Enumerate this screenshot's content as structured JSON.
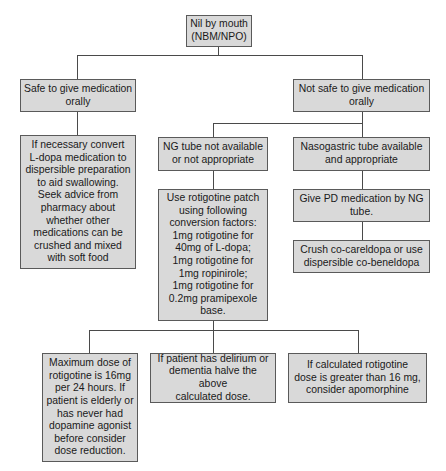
{
  "diagram": {
    "type": "flowchart",
    "root": {
      "label": "Nil by mouth\n(NBM/NPO)"
    },
    "branches": {
      "safe": {
        "label": "Safe to give medication\norally",
        "advice": "If necessary convert\nL-dopa medication to\ndispersible preparation\nto aid swallowing.\nSeek advice from\npharmacy about\nwhether other\nmedications can be\ncrushed and mixed\nwith soft food"
      },
      "not_safe": {
        "label": "Not safe to give medication\norally",
        "ng_not_available": {
          "label": "NG tube not available\nor not appropriate",
          "rotigotine": "Use rotigotine patch\nusing following\nconversion factors:\n1mg rotigotine for\n40mg of L-dopa;\n1mg rotigotine for\n1mg ropinirole;\n1mg rotigotine for\n0.2mg pramipexole\nbase.",
          "notes": [
            "Maximum dose of\nrotigotine is 16mg\nper 24 hours. If\npatient is elderly or\nhas never had\ndopamine agonist\nbefore consider\ndose reduction.",
            "If patient has delirium or\ndementia halve the above\ncalculated dose.",
            "If calculated rotigotine\ndose is greater than 16 mg,\nconsider apomorphine"
          ]
        },
        "ng_available": {
          "label": "Nasogastric tube available\nand appropriate",
          "give": "Give PD medication by NG\ntube.",
          "crush": "Crush co-careldopa or use\ndispersible co-beneldopa"
        }
      }
    },
    "colors": {
      "box_fill": "#d9d9d9",
      "box_border": "#5a5a5a",
      "connector": "#4a4a4a",
      "background": "#ffffff"
    }
  }
}
